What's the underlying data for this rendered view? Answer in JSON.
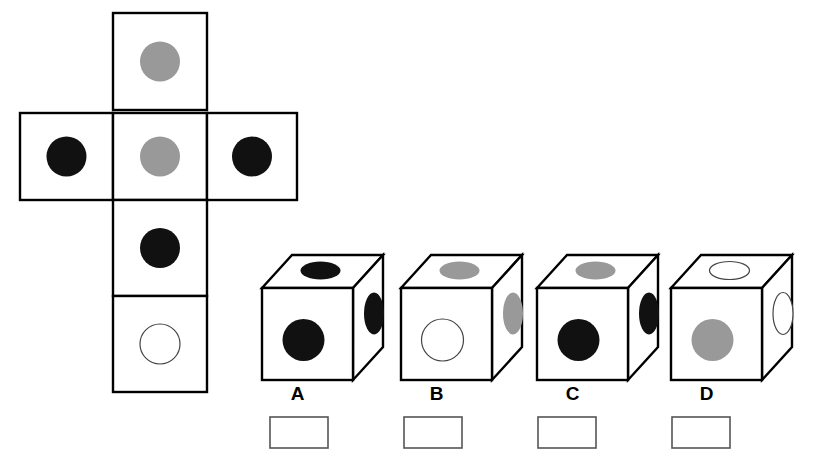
{
  "page": {
    "background_color": "#ffffff"
  },
  "colors": {
    "black_pip": "#111111",
    "gray_pip": "#999999",
    "white_pip": "#ffffff",
    "outline": "#000000",
    "pip_outline": "#444444",
    "box_outline": "#555555"
  },
  "net": {
    "name": "unfolded-cube-net",
    "layout": "cross",
    "cells": [
      {
        "position": "top",
        "pip_color": "gray",
        "pip_fill": "#999999",
        "x": 113,
        "y": 13,
        "w": 94,
        "h": 97
      },
      {
        "position": "middle-left",
        "pip_color": "black",
        "pip_fill": "#111111",
        "x": 20,
        "y": 113,
        "w": 93,
        "h": 87
      },
      {
        "position": "middle-center",
        "pip_color": "gray",
        "pip_fill": "#999999",
        "x": 113,
        "y": 113,
        "w": 94,
        "h": 87
      },
      {
        "position": "middle-right",
        "pip_color": "black",
        "pip_fill": "#111111",
        "x": 207,
        "y": 113,
        "w": 90,
        "h": 87
      },
      {
        "position": "lower",
        "pip_color": "black",
        "pip_fill": "#111111",
        "x": 113,
        "y": 200,
        "w": 94,
        "h": 96
      },
      {
        "position": "bottom",
        "pip_color": "white",
        "pip_fill": "#ffffff",
        "x": 113,
        "y": 296,
        "w": 94,
        "h": 96
      }
    ]
  },
  "options": [
    {
      "id": "A",
      "label": "A",
      "origin_x": 262,
      "faces": {
        "top": {
          "pip_color": "black",
          "pip_fill": "#111111"
        },
        "front": {
          "pip_color": "black",
          "pip_fill": "#111111"
        },
        "right": {
          "pip_color": "black",
          "pip_fill": "#111111"
        }
      },
      "answer_box_value": ""
    },
    {
      "id": "B",
      "label": "B",
      "origin_x": 401,
      "faces": {
        "top": {
          "pip_color": "gray",
          "pip_fill": "#999999"
        },
        "front": {
          "pip_color": "white",
          "pip_fill": "#ffffff"
        },
        "right": {
          "pip_color": "gray",
          "pip_fill": "#999999"
        }
      },
      "answer_box_value": ""
    },
    {
      "id": "C",
      "label": "C",
      "origin_x": 537,
      "faces": {
        "top": {
          "pip_color": "gray",
          "pip_fill": "#999999"
        },
        "front": {
          "pip_color": "black",
          "pip_fill": "#111111"
        },
        "right": {
          "pip_color": "black",
          "pip_fill": "#111111"
        }
      },
      "answer_box_value": ""
    },
    {
      "id": "D",
      "label": "D",
      "origin_x": 671,
      "faces": {
        "top": {
          "pip_color": "white",
          "pip_fill": "#ffffff"
        },
        "front": {
          "pip_color": "gray",
          "pip_fill": "#999999"
        },
        "right": {
          "pip_color": "white",
          "pip_fill": "#ffffff"
        }
      },
      "answer_box_value": ""
    }
  ],
  "answer_boxes": [
    {
      "for_option": "A",
      "value": "",
      "x": 270,
      "y": 417,
      "w": 58,
      "h": 31
    },
    {
      "for_option": "B",
      "value": "",
      "x": 404,
      "y": 417,
      "w": 58,
      "h": 31
    },
    {
      "for_option": "C",
      "value": "",
      "x": 538,
      "y": 417,
      "w": 58,
      "h": 31
    },
    {
      "for_option": "D",
      "value": "",
      "x": 672,
      "y": 417,
      "w": 58,
      "h": 31
    }
  ]
}
